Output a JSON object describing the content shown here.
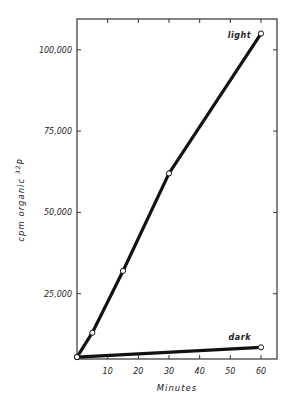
{
  "header": {
    "running_head": ""
  },
  "chart_data": {
    "type": "line",
    "title": "",
    "xlabel": "Minutes",
    "ylabel": "cpm organic 32P",
    "ylabel_parts": {
      "prefix": "cpm  organic",
      "superscript": "32",
      "suffix": "P"
    },
    "xlim": [
      0,
      60
    ],
    "ylim": [
      -6000,
      112000
    ],
    "x_ticks": [
      10,
      20,
      30,
      40,
      50,
      60
    ],
    "x_tick_labels": [
      "10",
      "20",
      "30",
      "40",
      "50",
      "60"
    ],
    "y_ticks": [
      25000,
      50000,
      75000,
      100000
    ],
    "y_tick_labels": [
      "25,000",
      "50,000",
      "75,000",
      "100,000"
    ],
    "grid": false,
    "legend": "inline labels at line ends",
    "series": [
      {
        "name": "light",
        "x": [
          0,
          5,
          15,
          30,
          60
        ],
        "values": [
          5500,
          13000,
          32000,
          62000,
          105000
        ]
      },
      {
        "name": "dark",
        "x": [
          0,
          60
        ],
        "values": [
          5500,
          8500
        ]
      }
    ]
  }
}
